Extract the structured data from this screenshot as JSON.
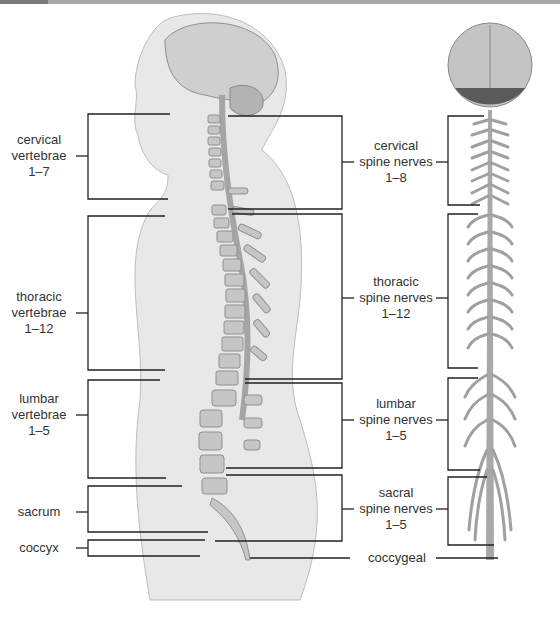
{
  "colors": {
    "line": "#222222",
    "body": "#e6e6e6",
    "bone": "#bdbdbd",
    "cord": "#9a9a9a",
    "text": "#333333"
  },
  "vertebrae_labels": [
    {
      "id": "cervical",
      "lines": [
        "cervical",
        "vertebrae",
        "1–7"
      ]
    },
    {
      "id": "thoracic",
      "lines": [
        "thoracic",
        "vertebrae",
        "1–12"
      ]
    },
    {
      "id": "lumbar",
      "lines": [
        "lumbar",
        "vertebrae",
        "1–5"
      ]
    },
    {
      "id": "sacrum",
      "lines": [
        "sacrum"
      ]
    },
    {
      "id": "coccyx",
      "lines": [
        "coccyx"
      ]
    }
  ],
  "nerve_labels": [
    {
      "id": "cervical",
      "lines": [
        "cervical",
        "spine nerves",
        "1–8"
      ]
    },
    {
      "id": "thoracic",
      "lines": [
        "thoracic",
        "spine nerves",
        "1–12"
      ]
    },
    {
      "id": "lumbar",
      "lines": [
        "lumbar",
        "spine nerves",
        "1–5"
      ]
    },
    {
      "id": "sacral",
      "lines": [
        "sacral",
        "spine nerves",
        "1–5"
      ]
    },
    {
      "id": "coccygeal",
      "lines": [
        "coccygeal"
      ]
    }
  ]
}
